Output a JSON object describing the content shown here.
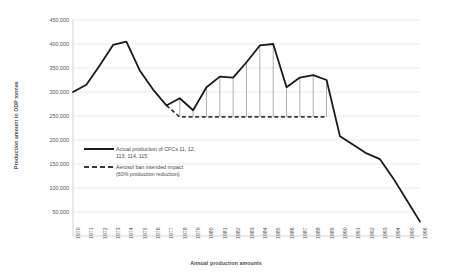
{
  "chart_data": {
    "type": "line",
    "title": "",
    "xlabel": "Annual production amounts",
    "ylabel": "Production amount in ODP tonnes",
    "categories": [
      "1970",
      "1971",
      "1972",
      "1973",
      "1974",
      "1975",
      "1976",
      "1977",
      "1978",
      "1979",
      "1980",
      "1981",
      "1982",
      "1983",
      "1984",
      "1985",
      "1986",
      "1987",
      "1988",
      "1989",
      "1990",
      "1991",
      "1992",
      "1993",
      "1994",
      "1995",
      "1996"
    ],
    "ylim": [
      0,
      450000
    ],
    "yticks": [
      450000,
      400000,
      350000,
      300000,
      250000,
      200000,
      150000,
      100000,
      50000
    ],
    "ytick_labels": [
      "450,000",
      "400,000",
      "350,000",
      "300,000",
      "250,000",
      "200,000",
      "150,000",
      "100,000",
      "50,000"
    ],
    "grid": true,
    "legend_position": "inside-left",
    "series": [
      {
        "name": "Actual production of CFCs 11, 12, 113, 114, 115",
        "style": "solid",
        "color": "#1a1a1a",
        "values": [
          300000,
          315000,
          355000,
          398000,
          405000,
          345000,
          305000,
          272000,
          287000,
          262000,
          310000,
          332000,
          330000,
          362000,
          397000,
          400000,
          310000,
          330000,
          335000,
          325000,
          208000,
          190000,
          172000,
          160000,
          120000,
          75000,
          30000
        ]
      },
      {
        "name": "Aerosol ban intended impact (60% production reduction)",
        "style": "dashed",
        "color": "#3a3a3a",
        "start_year": "1977",
        "end_year": "1989",
        "level": 248000,
        "values": [
          null,
          null,
          null,
          null,
          null,
          null,
          null,
          272000,
          248000,
          248000,
          248000,
          248000,
          248000,
          248000,
          248000,
          248000,
          248000,
          248000,
          248000,
          248000,
          null,
          null,
          null,
          null,
          null,
          null,
          null
        ]
      }
    ],
    "drop_lines": {
      "note": "vertical connectors from actual line down to aerosol-ban level",
      "years": [
        "1978",
        "1979",
        "1980",
        "1981",
        "1982",
        "1983",
        "1984",
        "1985",
        "1986",
        "1987",
        "1988",
        "1989"
      ]
    }
  },
  "legend": {
    "items": [
      {
        "label_line1": "Actual production of CFCs 11, 12,",
        "label_line2": "113, 114, 115",
        "style": "solid"
      },
      {
        "label_line1": "Aerosol ban intended impact",
        "label_line2": "(60% production reduction)",
        "style": "dashed"
      }
    ]
  },
  "colors": {
    "line": "#1a1a1a",
    "dashed": "#3a3a3a",
    "grid": "#e2e2e2",
    "axis": "#c8c8c8",
    "text": "#4a4a4a",
    "background": "#ffffff"
  }
}
